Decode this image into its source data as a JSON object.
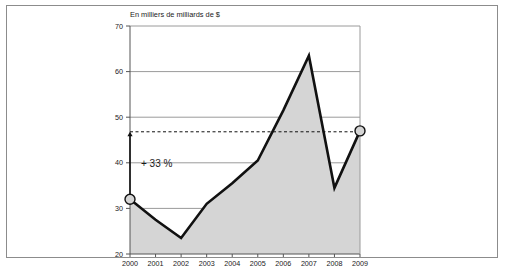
{
  "chart_data": {
    "type": "area",
    "title": "En milliers de milliards de $",
    "subtitle": "",
    "xlabel": "",
    "ylabel": "",
    "categories": [
      "2000",
      "2001",
      "2002",
      "2003",
      "2004",
      "2005",
      "2006",
      "2007",
      "2008",
      "2009"
    ],
    "values": [
      32.0,
      27.5,
      23.5,
      31.0,
      35.5,
      40.5,
      51.5,
      63.5,
      34.5,
      47.0
    ],
    "xlim": [
      2000,
      2009
    ],
    "ylim": [
      20,
      70
    ],
    "ytick_labels": [
      "20",
      "30",
      "40",
      "50",
      "60",
      "70"
    ],
    "ytick_values": [
      20,
      30,
      40,
      50,
      60,
      70
    ],
    "xtick_labels": [
      "2000",
      "2001",
      "2002",
      "2003",
      "2004",
      "2005",
      "2006",
      "2007",
      "2008",
      "2009"
    ],
    "grid": true,
    "grid_axis": "y",
    "legend": null,
    "legend_position": "none",
    "series": [
      {
        "name": "En milliers de milliards de $",
        "values": [
          32.0,
          27.5,
          23.5,
          31.0,
          35.5,
          40.5,
          51.5,
          63.5,
          34.5,
          47.0
        ]
      }
    ],
    "annotations": [
      {
        "text": "+ 33 %",
        "x": 2000,
        "y": 40.0,
        "kind": "growth-label"
      }
    ],
    "reference_line": {
      "kind": "dashed-horizontal",
      "value": 46.8,
      "from_x": 2000,
      "to_x": 2009
    },
    "markers": [
      {
        "x": "2000",
        "y": 32.0,
        "kind": "circle"
      },
      {
        "x": "2009",
        "y": 47.0,
        "kind": "circle"
      }
    ],
    "connector": {
      "kind": "vertical-arrow",
      "x": "2000",
      "from_y": 32.0,
      "to_y": 46.8
    },
    "colors": {
      "area_fill": "#d5d5d5",
      "line": "#111111",
      "grid": "#9a9a9a",
      "axis": "#555555",
      "frame": "#8c8c8c",
      "text": "#1a1a1a",
      "marker_fill": "#d5d5d5",
      "marker_stroke": "#111111",
      "background": "#ffffff"
    }
  },
  "figure": {
    "title": "En milliers de milliards de $",
    "frame_visible": true
  }
}
